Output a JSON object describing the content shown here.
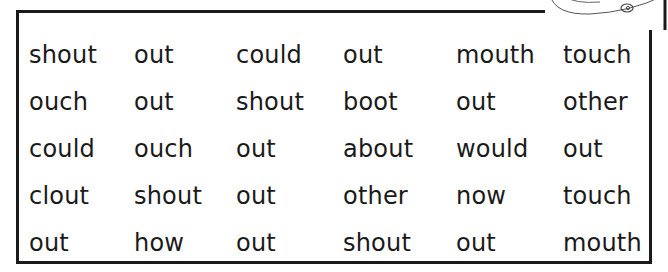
{
  "word_grid": {
    "rows": [
      [
        "shout",
        "out",
        "could",
        "out",
        "mouth",
        "touch"
      ],
      [
        "ouch",
        "out",
        "shout",
        "boot",
        "out",
        "other"
      ],
      [
        "could",
        "ouch",
        "out",
        "about",
        "would",
        "out"
      ],
      [
        "clout",
        "shout",
        "out",
        "other",
        "now",
        "touch"
      ],
      [
        "out",
        "how",
        "out",
        "shout",
        "out",
        "mouth"
      ]
    ]
  },
  "decoration": {
    "icon": "cartoon-illustration-corner"
  }
}
